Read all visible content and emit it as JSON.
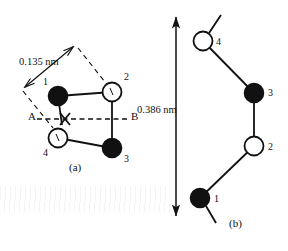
{
  "figure": {
    "background_color": "#ffffff",
    "ink_color": "#111111",
    "panels": [
      {
        "id": "panel-a",
        "caption": "(a)",
        "caption_pos": {
          "x": 72,
          "y": 168
        },
        "dimension": {
          "label": "0.135 nm",
          "label_pos": {
            "x": 20,
            "y": 63
          },
          "line": {
            "x1": 23,
            "y1": 88,
            "x2": 74,
            "y2": 46
          },
          "arrowheads": "both",
          "extension_lines": [
            {
              "x1": 23,
              "y1": 92,
              "x2": 52,
              "y2": 127
            },
            {
              "x1": 77,
              "y1": 47,
              "x2": 108,
              "y2": 86
            }
          ]
        },
        "axis": {
          "label_left": "A",
          "label_right": "B",
          "label_left_pos": {
            "x": 29,
            "y": 113
          },
          "label_right_pos": {
            "x": 132,
            "y": 113
          },
          "line": {
            "x1": 36,
            "y1": 119,
            "x2": 130,
            "y2": 119
          },
          "style": "dashed"
        },
        "cross_marker": {
          "x": 65,
          "y": 119,
          "size": 7
        },
        "atoms": [
          {
            "id": 1,
            "type": "filled",
            "cx": 58,
            "cy": 96,
            "r": 9.5,
            "label": "1",
            "label_pos": {
              "x": 44,
              "y": 82
            }
          },
          {
            "id": 2,
            "type": "open",
            "cx": 112,
            "cy": 92,
            "r": 9.5,
            "label": "2",
            "label_pos": {
              "x": 124,
              "y": 78
            }
          },
          {
            "id": 3,
            "type": "filled",
            "cx": 112,
            "cy": 148,
            "r": 9.5,
            "label": "3",
            "label_pos": {
              "x": 124,
              "y": 158
            }
          },
          {
            "id": 4,
            "type": "open",
            "cx": 58,
            "cy": 138,
            "r": 9.5,
            "label": "4",
            "label_pos": {
              "x": 44,
              "y": 152
            }
          }
        ],
        "bonds": [
          {
            "from": 1,
            "to": 2
          },
          {
            "from": 2,
            "to": 3
          },
          {
            "from": 3,
            "to": 4
          },
          {
            "from": 1,
            "to": 4
          }
        ]
      },
      {
        "id": "panel-b",
        "caption": "(b)",
        "caption_pos": {
          "x": 232,
          "y": 224
        },
        "dimension": {
          "label": "0.386 nm",
          "label_pos": {
            "x": 140,
            "y": 110
          },
          "line": {
            "x1": 176,
            "y1": 15,
            "x2": 176,
            "y2": 218
          },
          "arrowheads": "both"
        },
        "atoms": [
          {
            "id": 4,
            "type": "open",
            "cx": 203,
            "cy": 41,
            "r": 9.5,
            "label": "4",
            "label_pos": {
              "x": 216,
              "y": 42
            }
          },
          {
            "id": 3,
            "type": "filled",
            "cx": 254,
            "cy": 93,
            "r": 9.5,
            "label": "3",
            "label_pos": {
              "x": 268,
              "y": 93
            }
          },
          {
            "id": 2,
            "type": "open",
            "cx": 254,
            "cy": 146,
            "r": 9.5,
            "label": "2",
            "label_pos": {
              "x": 268,
              "y": 148
            }
          },
          {
            "id": 1,
            "type": "filled",
            "cx": 200,
            "cy": 198,
            "r": 9.5,
            "label": "1",
            "label_pos": {
              "x": 214,
              "y": 199
            }
          }
        ],
        "bonds": [
          {
            "from": 4,
            "to": 3
          },
          {
            "from": 3,
            "to": 2
          },
          {
            "from": 2,
            "to": 1
          }
        ],
        "free_bonds": [
          {
            "x1": 209,
            "y1": 33,
            "x2": 221,
            "y2": 15
          },
          {
            "x1": 206,
            "y1": 206,
            "x2": 216,
            "y2": 223
          }
        ]
      }
    ]
  }
}
